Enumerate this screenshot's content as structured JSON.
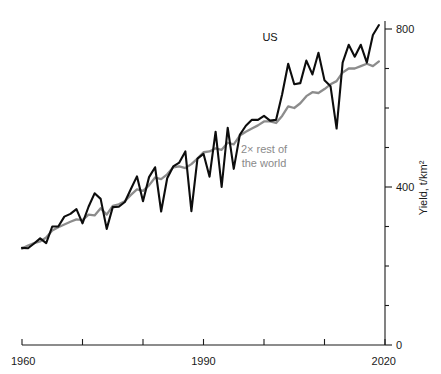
{
  "chart_data": {
    "type": "line",
    "title": "",
    "subtitle": "",
    "xlabel": "",
    "ylabel": "Yield, t/km²",
    "xlim": [
      1960,
      2020
    ],
    "ylim": [
      0,
      870
    ],
    "grid": false,
    "legend_position": "inline-annotations",
    "x_ticks": [
      1960,
      1970,
      1980,
      1990,
      2000,
      2010,
      2020
    ],
    "x_tick_labels": [
      "1960",
      "",
      "",
      "1990",
      "",
      "",
      "2020"
    ],
    "y_ticks": [
      0,
      100,
      200,
      300,
      400,
      500,
      600,
      700,
      800
    ],
    "y_tick_labels": [
      "0",
      "",
      "",
      "",
      "400",
      "",
      "",
      "",
      "800"
    ],
    "annotations": [
      {
        "text": "US",
        "x": 2001,
        "y": 770,
        "color": "#111111"
      },
      {
        "text": "2× rest of the world",
        "x": 2000,
        "y": 487,
        "color": "#8a8a8a"
      }
    ],
    "x": [
      1960,
      1961,
      1962,
      1963,
      1964,
      1965,
      1966,
      1967,
      1968,
      1969,
      1970,
      1971,
      1972,
      1973,
      1974,
      1975,
      1976,
      1977,
      1978,
      1979,
      1980,
      1981,
      1982,
      1983,
      1984,
      1985,
      1986,
      1987,
      1988,
      1989,
      1990,
      1991,
      1992,
      1993,
      1994,
      1995,
      1996,
      1997,
      1998,
      1999,
      2000,
      2001,
      2002,
      2003,
      2004,
      2005,
      2006,
      2007,
      2008,
      2009,
      2010,
      2011,
      2012,
      2013,
      2014,
      2015,
      2016,
      2017,
      2018,
      2019
    ],
    "series": [
      {
        "name": "US",
        "color": "#0d0d0d",
        "values": [
          246,
          245,
          257,
          270,
          258,
          300,
          300,
          325,
          332,
          344,
          308,
          350,
          384,
          370,
          294,
          349,
          350,
          362,
          395,
          427,
          364,
          425,
          450,
          338,
          422,
          452,
          462,
          490,
          339,
          472,
          484,
          426,
          540,
          400,
          550,
          446,
          532,
          555,
          570,
          570,
          580,
          568,
          570,
          635,
          712,
          660,
          663,
          720,
          685,
          740,
          670,
          655,
          548,
          715,
          760,
          730,
          760,
          715,
          785,
          810
        ]
      },
      {
        "name": "2× rest of the world",
        "color": "#8c8c8c",
        "values": [
          244,
          252,
          258,
          262,
          272,
          290,
          298,
          305,
          312,
          318,
          316,
          330,
          328,
          346,
          330,
          352,
          356,
          364,
          380,
          394,
          390,
          404,
          424,
          420,
          432,
          450,
          452,
          448,
          458,
          472,
          488,
          490,
          498,
          494,
          512,
          508,
          530,
          540,
          548,
          556,
          566,
          566,
          562,
          580,
          604,
          600,
          612,
          630,
          640,
          638,
          648,
          660,
          668,
          690,
          700,
          700,
          706,
          712,
          706,
          718
        ]
      }
    ]
  },
  "axes": {
    "x_axis_name": "year-axis",
    "y_axis_name": "yield-axis"
  }
}
